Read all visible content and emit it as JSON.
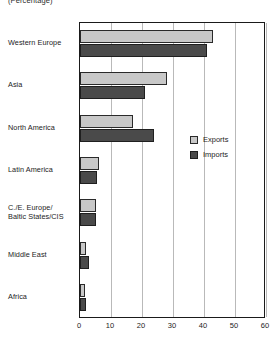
{
  "chart_data": {
    "type": "bar",
    "orientation": "horizontal",
    "title": "",
    "subtitle": "(Percentage)",
    "xlabel": "",
    "ylabel": "",
    "xlim": [
      0,
      60
    ],
    "xticks": [
      0,
      10,
      20,
      30,
      40,
      50,
      60
    ],
    "grid": true,
    "legend_position": "inside-right",
    "categories": [
      "Western Europe",
      "Asia",
      "North America",
      "Latin America",
      "C./E. Europe/\nBaltic States/CIS",
      "Middle East",
      "Africa"
    ],
    "series": [
      {
        "name": "Exports",
        "color": "#c8c8c8",
        "values": [
          43,
          28,
          17,
          6,
          5,
          2,
          1.5
        ]
      },
      {
        "name": "Imports",
        "color": "#4a4a4a",
        "values": [
          41,
          21,
          24,
          5.5,
          5,
          3,
          2
        ]
      }
    ]
  },
  "legend": {
    "items": [
      {
        "label": "Exports",
        "swatch": "exports"
      },
      {
        "label": "Imports",
        "swatch": "imports"
      }
    ]
  },
  "colors": {
    "exports": "#c8c8c8",
    "imports": "#4a4a4a",
    "axis": "#1a1a1a",
    "gridline": "#b9b9b9",
    "background": "#ffffff"
  }
}
